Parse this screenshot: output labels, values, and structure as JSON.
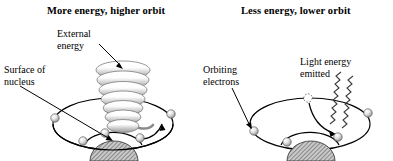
{
  "figure": {
    "type": "scientific-diagram",
    "background_color": "#ffffff",
    "ink_color": "#000000",
    "panel_count": 2
  },
  "panels": [
    {
      "id": "left",
      "title": "More energy, higher orbit",
      "labels": [
        {
          "id": "external-energy",
          "line1": "External",
          "line2": "energy"
        },
        {
          "id": "surface-of-nucleus",
          "line1": "Surface of",
          "line2": "nucleus"
        }
      ],
      "elements": {
        "helix": "tapered coil of external energy entering the atom",
        "nucleus": "hatched dome",
        "orbits": 2,
        "electrons": 5,
        "transition_arrow": "electron jumps outward to higher orbit"
      }
    },
    {
      "id": "right",
      "title": "Less energy, lower orbit",
      "labels": [
        {
          "id": "orbiting-electrons",
          "line1": "Orbiting",
          "line2": "electrons"
        },
        {
          "id": "light-energy-emitted",
          "line1": "Light energy",
          "line2": "emitted"
        }
      ],
      "elements": {
        "nucleus": "hatched dome",
        "orbits": 2,
        "electrons": 4,
        "vacated_position": "dotted open circle on outer orbit",
        "photon_waves": 2,
        "transition_arrow": "electron drops inward to lower orbit"
      }
    }
  ],
  "colors": {
    "nucleus_fill": "#c9c9c9",
    "electron_light": "#f2f2f2",
    "electron_shadow": "#9a9a9a",
    "helix_light": "#fbfbfb",
    "helix_shadow": "#a8a8a8"
  }
}
